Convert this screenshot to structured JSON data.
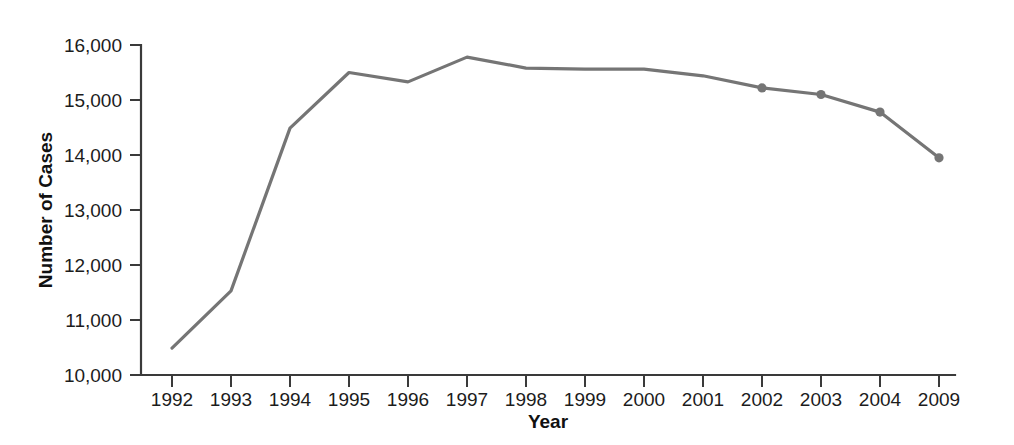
{
  "chart_data": {
    "type": "line",
    "title": "",
    "subtitle": "",
    "xlabel": "Year",
    "ylabel": "Number of Cases",
    "categories": [
      "1992",
      "1993",
      "1994",
      "1995",
      "1996",
      "1997",
      "1998",
      "1999",
      "2000",
      "2001",
      "2002",
      "2003",
      "2004",
      "2009"
    ],
    "values": [
      10490,
      11530,
      14490,
      15500,
      15330,
      15780,
      15580,
      15560,
      15560,
      15440,
      15220,
      15100,
      14780,
      13950
    ],
    "ylim": [
      10000,
      16000
    ],
    "ytick_values": [
      10000,
      11000,
      12000,
      13000,
      14000,
      15000,
      16000
    ],
    "ytick_labels": [
      "10,000",
      "11,000",
      "12,000",
      "13,000",
      "14,000",
      "15,000",
      "16,000"
    ],
    "xtick_labels": [
      "1992",
      "1993",
      "1994",
      "1995",
      "1996",
      "1997",
      "1998",
      "1999",
      "2000",
      "2001",
      "2002",
      "2003",
      "2004",
      "2009"
    ],
    "grid": false,
    "legend": false,
    "legend_position": "none",
    "marker_categories": [
      "2002",
      "2003",
      "2004",
      "2009"
    ],
    "series": [
      {
        "name": "Number of Cases",
        "values": [
          10490,
          11530,
          14490,
          15500,
          15330,
          15780,
          15580,
          15560,
          15560,
          15440,
          15220,
          15100,
          14780,
          13950
        ]
      }
    ],
    "annotations": []
  },
  "colors": {
    "line": "#757575",
    "marker": "#757575",
    "axis": "#3a3a3a",
    "text": "#1c1c1c",
    "background": "#ffffff"
  },
  "axes": {
    "x_axis_label": "Year",
    "y_axis_label": "Number of Cases"
  }
}
